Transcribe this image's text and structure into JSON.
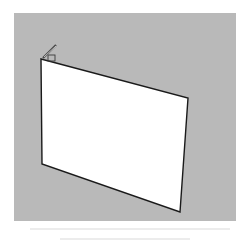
{
  "scene": {
    "background_color": "#b9b9b9",
    "panel_color": "#ffffff",
    "edge_color": "#1a1a1a",
    "panel_corners": [
      [
        41,
        59
      ],
      [
        188,
        98
      ],
      [
        180,
        212
      ],
      [
        42,
        164
      ]
    ],
    "hinge_handle": {
      "from": [
        43,
        57
      ],
      "to": [
        56,
        45
      ]
    }
  }
}
